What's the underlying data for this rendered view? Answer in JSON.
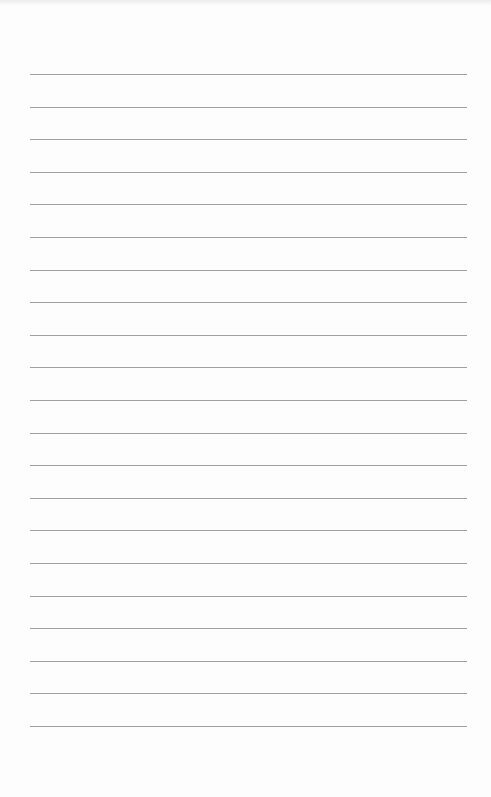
{
  "document": {
    "type": "lined-paper",
    "background_color": "#fdfdfd",
    "line_color": "#8f8f8f",
    "line_count": 21,
    "first_line_y": 74,
    "line_spacing": 32.6,
    "line_left": 30,
    "line_width": 437,
    "text_lines": [
      "",
      "",
      "",
      "",
      "",
      "",
      "",
      "",
      "",
      "",
      "",
      "",
      "",
      "",
      "",
      "",
      "",
      "",
      "",
      "",
      ""
    ]
  }
}
